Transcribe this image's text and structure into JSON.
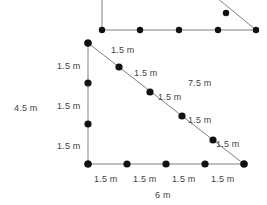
{
  "diagram": {
    "units": "m",
    "stroke_color": "#808080",
    "dot_color": "#111111",
    "text_color": "#3f3f3f",
    "background": "#ffffff",
    "top_partial_figure": {
      "description": "cropped duplicate of the same triangle above the main figure",
      "baseline_dots": 5,
      "hypotenuse_dots": 2
    },
    "main_triangle": {
      "vertices": {
        "top_left": [
          88,
          43
        ],
        "bottom_left": [
          88,
          164
        ],
        "bottom_right": [
          244,
          164
        ]
      },
      "left_edge_dots": 4,
      "bottom_edge_dots": 5,
      "hypotenuse_dots": 6
    },
    "labels": {
      "left_total": "4.5 m",
      "bottom_total": "6 m",
      "hypotenuse_total": "7.5 m",
      "segment": "1.5 m",
      "left_segments": [
        "1.5 m",
        "1.5 m",
        "1.5 m"
      ],
      "bottom_segments": [
        "1.5 m",
        "1.5 m",
        "1.5 m",
        "1.5 m"
      ],
      "hypotenuse_segments": [
        "1.5 m",
        "1.5 m",
        "1.5 m",
        "1.5 m",
        "1.5 m"
      ]
    }
  },
  "text_items": [
    {
      "id": "seg-hyp-1",
      "text": "1.5 m",
      "x": 111,
      "y": 45
    },
    {
      "id": "seg-left-1",
      "text": "1.5 m",
      "x": 57,
      "y": 61
    },
    {
      "id": "seg-hyp-2",
      "text": "1.5 m",
      "x": 134,
      "y": 68
    },
    {
      "id": "total-hyp",
      "text": "7.5 m",
      "x": 188,
      "y": 78
    },
    {
      "id": "total-left",
      "text": "4.5 m",
      "x": 14,
      "y": 103
    },
    {
      "id": "seg-left-2",
      "text": "1.5 m",
      "x": 57,
      "y": 101
    },
    {
      "id": "seg-hyp-3",
      "text": "1.5 m",
      "x": 158,
      "y": 92
    },
    {
      "id": "seg-hyp-4",
      "text": "1.5 m",
      "x": 188,
      "y": 115
    },
    {
      "id": "seg-left-3",
      "text": "1.5 m",
      "x": 57,
      "y": 141
    },
    {
      "id": "seg-hyp-5",
      "text": "1.5 m",
      "x": 216,
      "y": 139
    },
    {
      "id": "seg-bot-1",
      "text": "1.5 m",
      "x": 94,
      "y": 174
    },
    {
      "id": "seg-bot-2",
      "text": "1.5 m",
      "x": 133,
      "y": 174
    },
    {
      "id": "seg-bot-3",
      "text": "1.5 m",
      "x": 172,
      "y": 174
    },
    {
      "id": "seg-bot-4",
      "text": "1.5 m",
      "x": 211,
      "y": 174
    },
    {
      "id": "total-bot",
      "text": "6 m",
      "x": 155,
      "y": 190
    }
  ]
}
